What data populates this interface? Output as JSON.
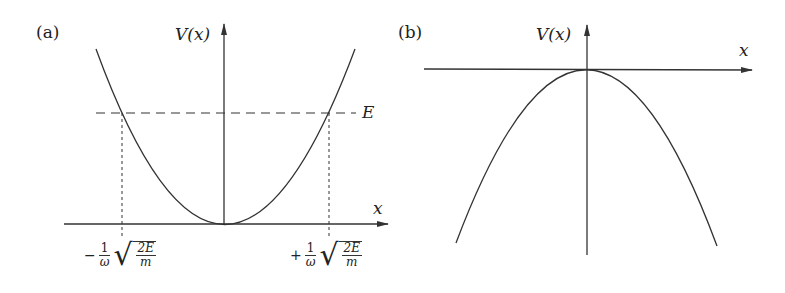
{
  "panels": [
    {
      "label": "(a)",
      "y_axis_label": "V(x)",
      "x_axis_label": "x",
      "curve": "upward parabola (harmonic potential)",
      "energy_level_label": "E",
      "turning_points": [
        {
          "sign": "−",
          "frac_num": "1",
          "frac_den": "ω",
          "sqrt_num": "2E",
          "sqrt_den": "m"
        },
        {
          "sign": "+",
          "frac_num": "1",
          "frac_den": "ω",
          "sqrt_num": "2E",
          "sqrt_den": "m"
        }
      ]
    },
    {
      "label": "(b)",
      "y_axis_label": "V(x)",
      "x_axis_label": "x",
      "curve": "downward parabola (inverted potential)"
    }
  ],
  "colors": {
    "line": "#333333",
    "background": "#ffffff"
  }
}
